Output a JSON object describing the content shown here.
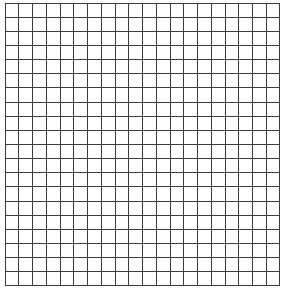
{
  "page": {
    "width": 284,
    "height": 298,
    "background_color": "#ffffff"
  },
  "figure": {
    "name": "square-grid",
    "bounds": {
      "x": 5,
      "y": 3,
      "width": 275,
      "height": 283
    },
    "line_color": "#3c3c3c",
    "line_width": 1,
    "cell_fill": "#ffffff"
  },
  "chart_data": {
    "type": "grid",
    "title": "",
    "subtitle": "",
    "xlabel": "",
    "ylabel": "",
    "columns": 20,
    "rows": 20,
    "cell_width": 13.75,
    "cell_height": 14.15,
    "grid": true,
    "legend": null,
    "x_tick_labels": [],
    "y_tick_labels": [],
    "annotations": [],
    "series": []
  }
}
